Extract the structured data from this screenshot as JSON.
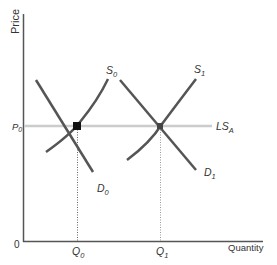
{
  "diagram": {
    "y_axis_label": "Price",
    "x_axis_label": "Quantity",
    "origin_label": "0",
    "price_label": "P",
    "price_sub": "0",
    "q0_label": "Q",
    "q0_sub": "0",
    "q1_label": "Q",
    "q1_sub": "1",
    "curves": {
      "s0": {
        "label": "S",
        "sub": "0"
      },
      "s1": {
        "label": "S",
        "sub": "1"
      },
      "d0": {
        "label": "D",
        "sub": "0"
      },
      "d1": {
        "label": "D",
        "sub": "1"
      },
      "lsa": {
        "label": "LS",
        "sub": "A"
      }
    },
    "colors": {
      "axis": "#555555",
      "curve": "#555555",
      "supply_line": "#cccccc",
      "equilibrium": "#111111",
      "dotted": "#777777"
    }
  }
}
